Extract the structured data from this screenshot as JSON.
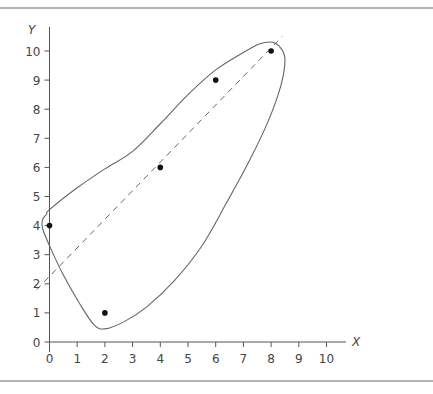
{
  "chart_data": {
    "type": "scatter",
    "title": "",
    "xlabel": "X",
    "ylabel": "Y",
    "xlim": [
      0,
      10
    ],
    "ylim": [
      0,
      10
    ],
    "grid": false,
    "legend": null,
    "x_ticks": [
      "0",
      "1",
      "2",
      "3",
      "4",
      "5",
      "6",
      "7",
      "8",
      "9",
      "10"
    ],
    "y_ticks": [
      "0",
      "1",
      "2",
      "3",
      "4",
      "5",
      "6",
      "7",
      "8",
      "9",
      "10"
    ],
    "series": [
      {
        "name": "points",
        "type": "scatter",
        "x": [
          0,
          2,
          4,
          6,
          8
        ],
        "y": [
          4,
          1,
          6,
          9,
          10
        ]
      },
      {
        "name": "fitted-line",
        "type": "line",
        "style": "dashed",
        "x": [
          0,
          8.4
        ],
        "y": [
          2,
          10.5
        ]
      }
    ],
    "annotations": [
      {
        "type": "envelope",
        "description": "closed curve enclosing all data points and the fitted line"
      }
    ]
  },
  "colors": {
    "axis": "#555555",
    "curve": "#666666",
    "point": "#111111",
    "rule": "#b4b4b4"
  }
}
